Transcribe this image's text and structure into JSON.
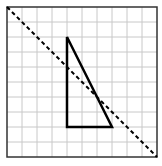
{
  "figure": {
    "type": "grid-reflection-diagram",
    "grid": {
      "columns": 10,
      "rows": 10,
      "cell_px": 15,
      "origin_px": [
        7,
        7
      ],
      "line_color": "#c8c8c8",
      "border_color": "#333333"
    },
    "triangle": {
      "vertices_grid": [
        [
          4,
          2
        ],
        [
          4,
          8
        ],
        [
          7,
          8
        ]
      ],
      "stroke_color": "#000000",
      "stroke_width": 2.5
    },
    "line_of_reflection": {
      "from_grid": [
        0,
        0
      ],
      "to_grid": [
        10,
        10
      ],
      "style": "dashed",
      "stroke_color": "#000000"
    }
  }
}
